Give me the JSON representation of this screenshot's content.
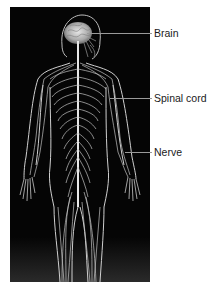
{
  "figure": {
    "background_color": "#050505",
    "nerve_color": "#d8d8d8",
    "labels": [
      {
        "id": "brain",
        "text": "Brain",
        "y": 33
      },
      {
        "id": "spinal-cord",
        "text": "Spinal cord",
        "y": 98
      },
      {
        "id": "nerve",
        "text": "Nerve",
        "y": 152
      }
    ]
  }
}
